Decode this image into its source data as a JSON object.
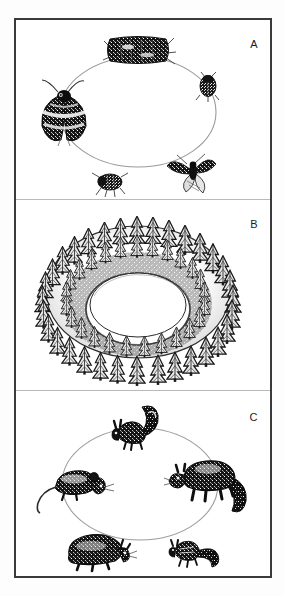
{
  "figure": {
    "background_color": "#ffffff",
    "border_color": "#3a3a3a",
    "ink_color": "#1c1c1c",
    "arrow_color": "#8a8a8a"
  },
  "panels": [
    {
      "id": "A",
      "label": "A",
      "caption_visible": false,
      "cycle_kind": "insect-life-cycle",
      "nodes": [
        {
          "name": "larva",
          "label": "larva",
          "icon": "caterpillar-icon",
          "angle_deg": 270,
          "size": "large"
        },
        {
          "name": "pupa-right",
          "label": "pupa",
          "icon": "beetle-icon",
          "angle_deg": 330,
          "size": "small"
        },
        {
          "name": "adult-moth-flying",
          "label": "adult moth",
          "icon": "moth-flying-icon",
          "angle_deg": 45,
          "size": "medium"
        },
        {
          "name": "pupa-bottom",
          "label": "pupa",
          "icon": "pupa-icon",
          "angle_deg": 115,
          "size": "small"
        },
        {
          "name": "adult-moth-resting",
          "label": "adult moth",
          "icon": "moth-resting-icon",
          "angle_deg": 180,
          "size": "large"
        }
      ]
    },
    {
      "id": "B",
      "label": "B",
      "caption_visible": false,
      "cycle_kind": "forest-ring",
      "description": "annular stand of conifer trees forming a ring with an open clearing at the centre",
      "tree_count_outer": 64,
      "tree_count_inner": 34
    },
    {
      "id": "C",
      "label": "C",
      "caption_visible": false,
      "cycle_kind": "mammal-cycle",
      "nodes": [
        {
          "name": "squirrel",
          "label": "squirrel",
          "icon": "squirrel-icon",
          "angle_deg": 270,
          "size": "medium"
        },
        {
          "name": "marten",
          "label": "marten",
          "icon": "marten-icon",
          "angle_deg": 340,
          "size": "large"
        },
        {
          "name": "chipmunk",
          "label": "chipmunk",
          "icon": "chipmunk-icon",
          "angle_deg": 55,
          "size": "small"
        },
        {
          "name": "marmot",
          "label": "marmot",
          "icon": "marmot-icon",
          "angle_deg": 125,
          "size": "medium"
        },
        {
          "name": "vole",
          "label": "vole",
          "icon": "vole-icon",
          "angle_deg": 195,
          "size": "medium"
        }
      ]
    }
  ]
}
